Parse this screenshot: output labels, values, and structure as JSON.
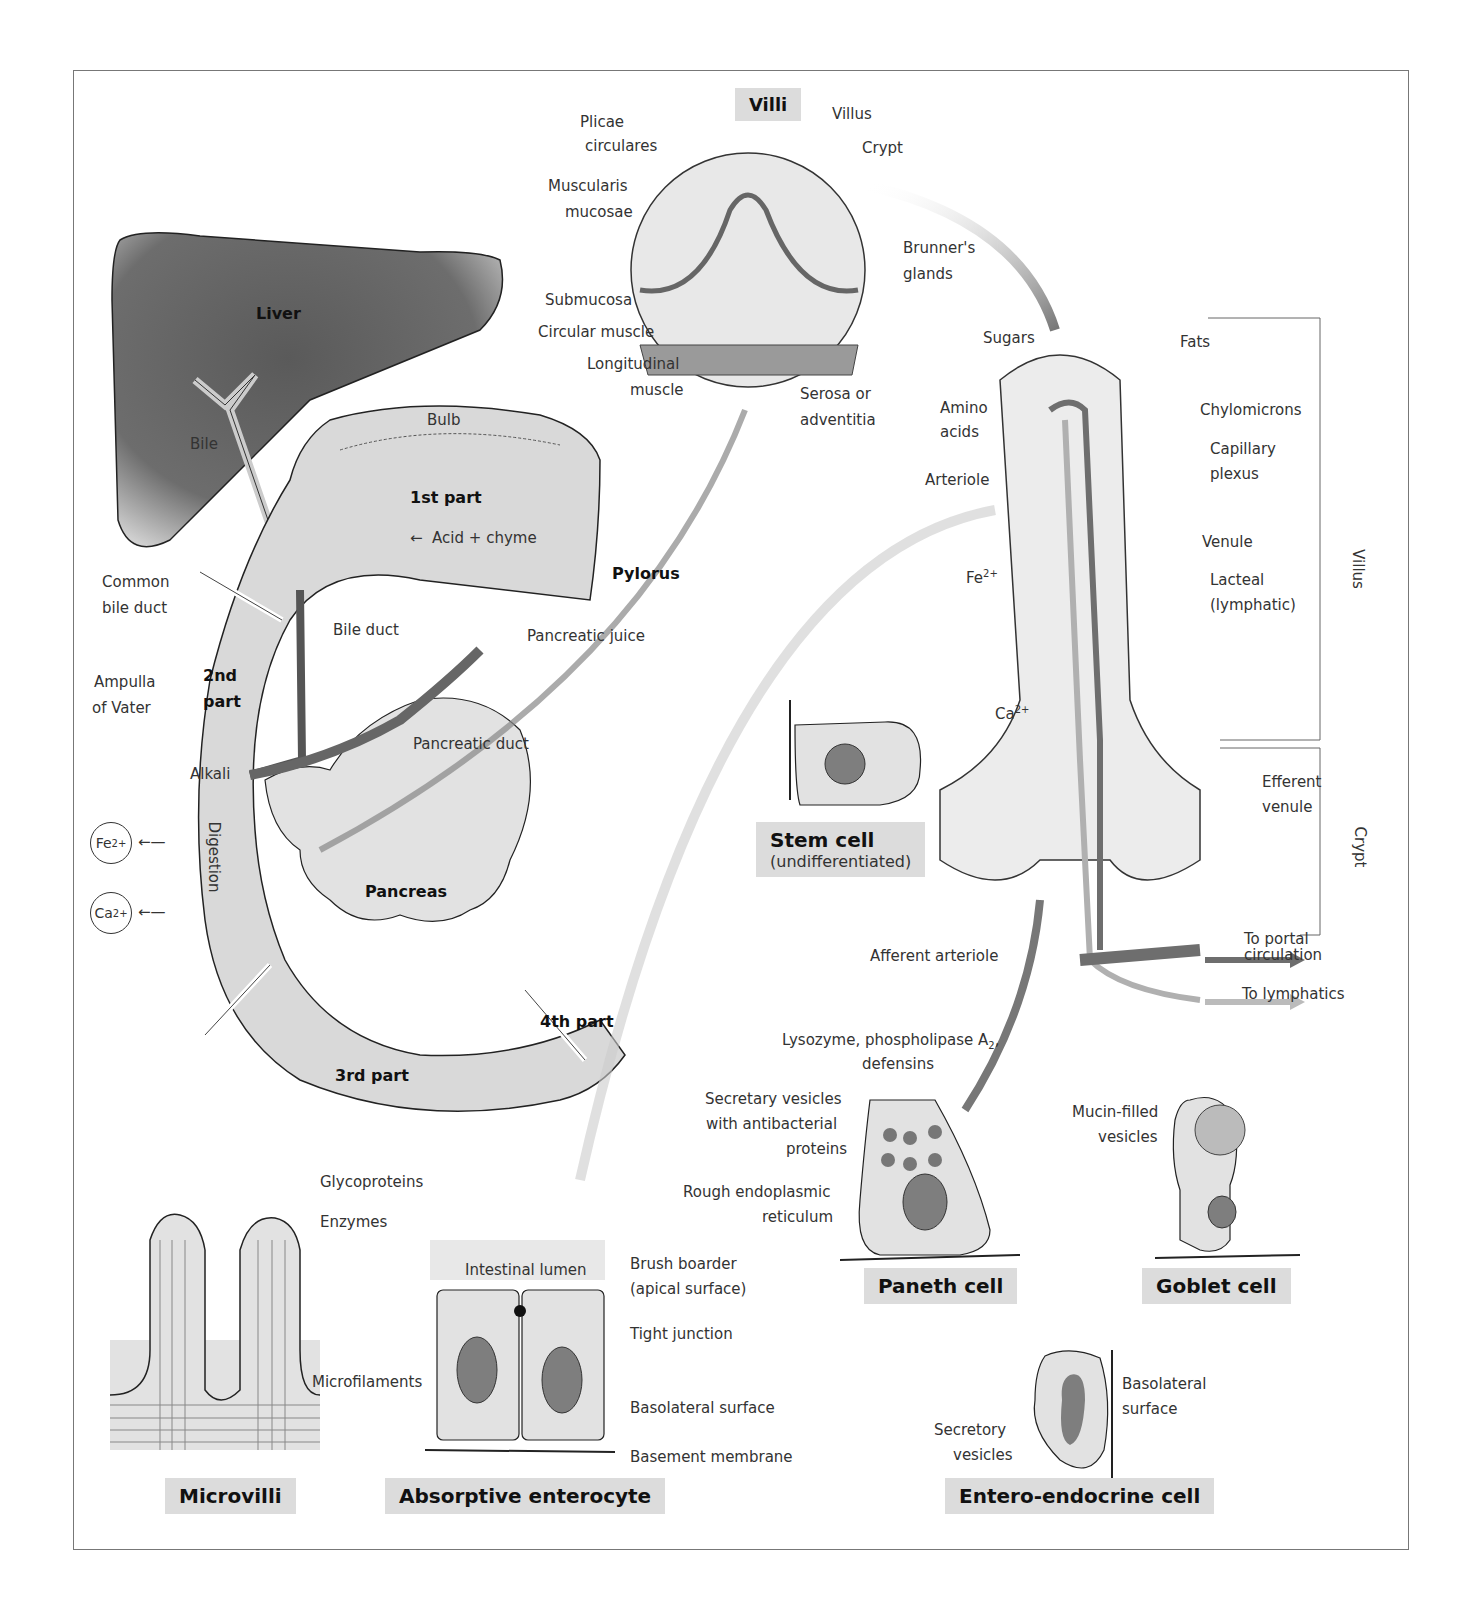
{
  "panels": {
    "villi": {
      "title": "Villi",
      "labels": {
        "plicae": "Plicae\ncirculares",
        "plicae_1": "Plicae",
        "plicae_2": "circulares",
        "villus": "Villus",
        "crypt": "Crypt",
        "muscularis_1": "Muscularis",
        "muscularis_2": "mucosae",
        "brunners_1": "Brunner's",
        "brunners_2": "glands",
        "submucosa": "Submucosa",
        "circular_muscle": "Circular muscle",
        "longitudinal_1": "Longitudinal",
        "longitudinal_2": "muscle",
        "serosa_1": "Serosa or",
        "serosa_2": "adventitia"
      }
    },
    "duodenum": {
      "labels": {
        "liver": "Liver",
        "bile": "Bile",
        "bulb": "Bulb",
        "first_part": "1st part",
        "acid_chyme": "Acid + chyme",
        "pylorus": "Pylorus",
        "common_bile_1": "Common",
        "common_bile_2": "bile duct",
        "bile_duct": "Bile duct",
        "pancreatic_juice": "Pancreatic juice",
        "second_part_1": "2nd",
        "second_part_2": "part",
        "ampulla_1": "Ampulla",
        "ampulla_2": "of Vater",
        "pancreatic_duct": "Pancreatic duct",
        "alkali": "Alkali",
        "digestion": "Digestion",
        "pancreas": "Pancreas",
        "third_part": "3rd part",
        "fourth_part": "4th part"
      },
      "ions": [
        {
          "symbol": "Fe",
          "charge": "2+"
        },
        {
          "symbol": "Ca",
          "charge": "2+"
        }
      ]
    },
    "villus_detail": {
      "labels": {
        "sugars": "Sugars",
        "fats": "Fats",
        "amino_1": "Amino",
        "amino_2": "acids",
        "chylomicrons": "Chylomicrons",
        "capillary_1": "Capillary",
        "capillary_2": "plexus",
        "arteriole": "Arteriole",
        "venule": "Venule",
        "fe": "Fe",
        "fe_charge": "2+",
        "lacteal_1": "Lacteal",
        "lacteal_2": "(lymphatic)",
        "ca": "Ca",
        "ca_charge": "2+",
        "efferent_1": "Efferent",
        "efferent_2": "venule",
        "afferent": "Afferent arteriole",
        "to_portal_1": "To portal",
        "to_portal_2": "circulation",
        "to_lymphatics": "To lymphatics",
        "villus_bracket": "Villus",
        "crypt_bracket": "Crypt"
      }
    },
    "stem_cell": {
      "title": "Stem cell",
      "subtitle": "(undifferentiated)"
    },
    "paneth_cell": {
      "title": "Paneth cell",
      "labels": {
        "lysozyme_1": "Lysozyme, phospholipase A",
        "lysozyme_sub": "2",
        "lysozyme_comma": ",",
        "lysozyme_2": "defensins",
        "secretary_1": "Secretary vesicles",
        "secretary_2": "with antibacterial",
        "secretary_3": "proteins",
        "rer_1": "Rough endoplasmic",
        "rer_2": "reticulum"
      }
    },
    "goblet_cell": {
      "title": "Goblet cell",
      "labels": {
        "mucin_1": "Mucin-filled",
        "mucin_2": "vesicles"
      }
    },
    "microvilli": {
      "title": "Microvilli",
      "labels": {
        "glycoproteins": "Glycoproteins",
        "enzymes": "Enzymes",
        "microfilaments": "Microfilaments"
      }
    },
    "enterocyte": {
      "title": "Absorptive enterocyte",
      "labels": {
        "lumen": "Intestinal lumen",
        "brush_1": "Brush boarder",
        "brush_2": "(apical surface)",
        "tight": "Tight junction",
        "basolateral": "Basolateral surface",
        "basement": "Basement membrane"
      }
    },
    "enteroendocrine": {
      "title": "Entero-endocrine cell",
      "labels": {
        "basolateral_1": "Basolateral",
        "basolateral_2": "surface",
        "secretory_1": "Secretory",
        "secretory_2": "vesicles"
      }
    }
  },
  "colors": {
    "liver": "#555555",
    "tissue": "#d9d9d9",
    "vessel": "#6e6e6e",
    "lymph": "#b0b0b0",
    "title_bg": "#dcdcdc",
    "line": "#333333"
  }
}
